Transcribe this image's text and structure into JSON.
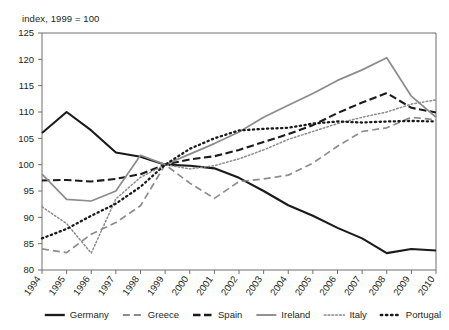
{
  "subtitle": "index, 1999 = 100",
  "chart_data": {
    "type": "line",
    "title": "",
    "subtitle": "index, 1999 = 100",
    "xlabel": "",
    "ylabel": "",
    "ylim": [
      80,
      125
    ],
    "ytick_step": 5,
    "yticks": [
      80,
      85,
      90,
      95,
      100,
      105,
      110,
      115,
      120,
      125
    ],
    "grid": false,
    "legend_position": "bottom",
    "categories": [
      1994,
      1995,
      1996,
      1997,
      1998,
      1999,
      2000,
      2001,
      2002,
      2003,
      2004,
      2005,
      2006,
      2007,
      2008,
      2009,
      2010
    ],
    "xticks": [
      "1994",
      "1995",
      "1996",
      "1997",
      "1998",
      "1999",
      "2000",
      "2001",
      "2002",
      "2003",
      "2004",
      "2005",
      "2006",
      "2007",
      "2008",
      "2009",
      "2010"
    ],
    "series": [
      {
        "name": "Germany",
        "style": "solid",
        "color": "#1a1a1a",
        "width": 2.1,
        "values": [
          106.0,
          110.0,
          106.5,
          102.3,
          101.5,
          100.0,
          99.8,
          99.3,
          97.5,
          95.0,
          92.3,
          90.3,
          88.0,
          86.0,
          83.2,
          84.0,
          83.7
        ]
      },
      {
        "name": "Greece",
        "style": "dashed",
        "color": "#8c8c8c",
        "width": 1.7,
        "values": [
          84.0,
          83.3,
          86.8,
          89.0,
          92.2,
          100.0,
          96.5,
          93.6,
          96.8,
          97.3,
          98.0,
          100.3,
          103.5,
          106.3,
          107.0,
          109.0,
          108.5
        ]
      },
      {
        "name": "Spain",
        "style": "dashed-bold",
        "color": "#1a1a1a",
        "width": 2.1,
        "values": [
          97.0,
          97.1,
          96.8,
          97.3,
          98.2,
          100.0,
          101.0,
          101.6,
          102.8,
          104.3,
          105.8,
          107.5,
          109.8,
          111.8,
          113.6,
          110.8,
          109.9
        ]
      },
      {
        "name": "Ireland",
        "style": "solid",
        "color": "#8c8c8c",
        "width": 1.7,
        "values": [
          98.2,
          93.4,
          93.1,
          95.0,
          101.8,
          100.0,
          102.0,
          104.0,
          106.2,
          109.0,
          111.3,
          113.5,
          116.0,
          118.0,
          120.3,
          113.0,
          109.0
        ]
      },
      {
        "name": "Italy",
        "style": "dotted-fine",
        "color": "#8c8c8c",
        "width": 1.5,
        "values": [
          92.0,
          88.8,
          83.2,
          93.5,
          97.6,
          100.0,
          99.2,
          99.8,
          101.1,
          102.8,
          104.8,
          106.3,
          107.8,
          109.0,
          110.0,
          111.5,
          112.3
        ]
      },
      {
        "name": "Portugal",
        "style": "dotted-bold",
        "color": "#1a1a1a",
        "width": 2.3,
        "values": [
          86.0,
          87.8,
          90.3,
          92.6,
          95.8,
          100.0,
          103.0,
          105.0,
          106.5,
          106.8,
          107.0,
          107.8,
          108.2,
          108.0,
          108.2,
          108.3,
          108.2
        ]
      }
    ]
  },
  "legend": [
    {
      "label": "Germany"
    },
    {
      "label": "Greece"
    },
    {
      "label": "Spain"
    },
    {
      "label": "Ireland"
    },
    {
      "label": "Italy"
    },
    {
      "label": "Portugal"
    }
  ]
}
